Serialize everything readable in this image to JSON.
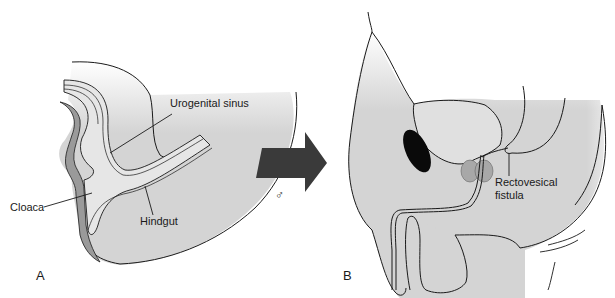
{
  "figure": {
    "panels": [
      {
        "id": "A",
        "letter": "A",
        "description": "Embryonic cloaca",
        "labels": {
          "urogenital_sinus": "Urogenital sinus",
          "cloaca": "Cloaca",
          "hindgut": "Hindgut"
        }
      },
      {
        "id": "B",
        "letter": "B",
        "description": "Male pelvis with fistula",
        "labels": {
          "rectovesical_fistula_line1": "Rectovesical",
          "rectovesical_fistula_line2": "fistula"
        }
      }
    ],
    "transition": {
      "arrow": "right-arrow",
      "symbol": "♂"
    },
    "colors": {
      "tissue_fill": "#d4d4d4",
      "lumen_fill": "#e6e6e6",
      "dark_band": "#9a9a9a",
      "arrow": "#3a3a3a",
      "prostate": "#a8a8a8",
      "symphysis": "#0a0a0a",
      "outline": "#1a1a1a"
    }
  }
}
